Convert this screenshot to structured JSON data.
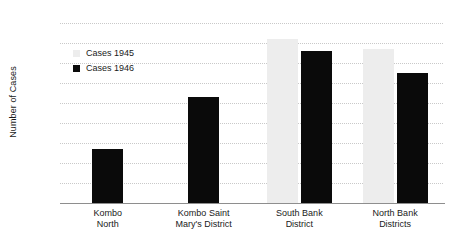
{
  "chart_data": {
    "type": "bar",
    "title": "",
    "xlabel": "",
    "ylabel": "Number of Cases",
    "ylim": [
      0,
      450
    ],
    "ytick_step": 50,
    "yticks": [
      "450",
      "400",
      "350",
      "300",
      "250",
      "200",
      "150",
      "100",
      "50",
      "0"
    ],
    "grid": true,
    "legend_position": "inside-upper-left",
    "categories": [
      "Kombo North",
      "Kombo Saint Mary's District",
      "South Bank District",
      "North Bank Districts"
    ],
    "category_lines": [
      [
        "Kombo",
        "North"
      ],
      [
        "Kombo Saint",
        "Mary's District"
      ],
      [
        "South Bank",
        "District"
      ],
      [
        "North Bank",
        "Districts"
      ]
    ],
    "series": [
      {
        "name": "Cases 1945",
        "color": "#ededed",
        "values": [
          null,
          null,
          410,
          385
        ]
      },
      {
        "name": "Cases 1946",
        "color": "#0a0a0a",
        "values": [
          135,
          265,
          380,
          325
        ]
      }
    ]
  },
  "legend": {
    "items": [
      {
        "label": "Cases 1945",
        "swatch": "light-gray-square"
      },
      {
        "label": "Cases 1946",
        "swatch": "black-square"
      }
    ]
  },
  "axis": {
    "y_title": "Number of Cases"
  }
}
